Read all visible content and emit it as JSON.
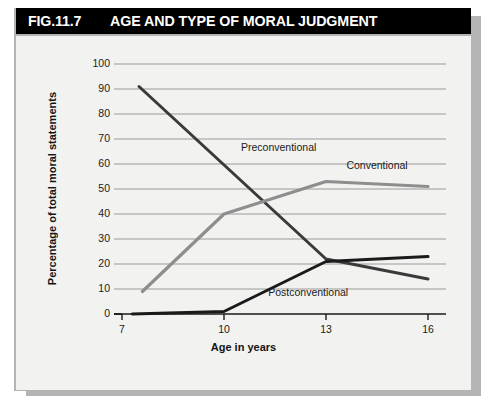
{
  "figure": {
    "number": "FIG.11.7",
    "title": "AGE AND TYPE OF MORAL JUDGMENT",
    "source": "Source: Kohlberg (1963)"
  },
  "colors": {
    "header_bg": "#000000",
    "header_text": "#ffffff",
    "panel_bg": "#f2f2f0",
    "frame": "#b4b4b4",
    "gridline": "#9a9a9a",
    "axis": "#1a1a1a",
    "preconventional": "#3a3a3a",
    "conventional": "#8e8e8e",
    "postconventional": "#1a1a1a"
  },
  "chart_data": {
    "type": "line",
    "title": "AGE AND TYPE OF MORAL JUDGMENT",
    "xlabel": "Age in years",
    "ylabel": "Percentage of total moral statements",
    "xlim": [
      7,
      16
    ],
    "ylim": [
      0,
      100
    ],
    "xticks": [
      7,
      10,
      13,
      16
    ],
    "yticks": [
      0,
      10,
      20,
      30,
      40,
      50,
      60,
      70,
      80,
      90,
      100
    ],
    "xtick_labels": [
      "7",
      "10",
      "13",
      "16"
    ],
    "ytick_labels": [
      "0",
      "10",
      "20",
      "30",
      "40",
      "50",
      "60",
      "70",
      "80",
      "90",
      "100"
    ],
    "grid": true,
    "legend": "inline-annotations",
    "series": [
      {
        "name": "Preconventional",
        "color": "#3a3a3a",
        "label_x": 10.5,
        "label_y": 66,
        "x": [
          7.5,
          13,
          16
        ],
        "values": [
          91,
          22,
          14
        ]
      },
      {
        "name": "Conventional",
        "color": "#8e8e8e",
        "label_x": 13.6,
        "label_y": 59,
        "x": [
          7.6,
          10,
          13,
          16
        ],
        "values": [
          9,
          40,
          53,
          51
        ]
      },
      {
        "name": "Postconventional",
        "color": "#1a1a1a",
        "label_x": 11.3,
        "label_y": 8,
        "x": [
          7.3,
          10,
          13,
          16
        ],
        "values": [
          0,
          1,
          21,
          23
        ]
      }
    ]
  }
}
